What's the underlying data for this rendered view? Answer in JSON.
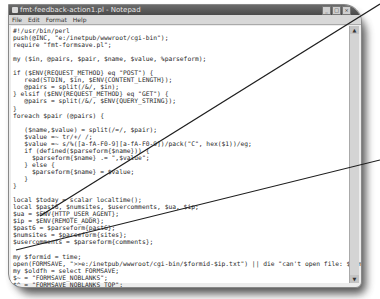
{
  "window": {
    "title": "fmt-feedback-action1.pl - Notepad",
    "controls": [
      "_",
      "□",
      "×"
    ]
  },
  "menu": [
    "File",
    "Edit",
    "Format",
    "Help"
  ],
  "code_lines": [
    "#!/usr/bin/perl",
    "push(@INC, \"e:/inetpub/wwwroot/cgi-bin\");",
    "require \"fmt-formsave.pl\";",
    "",
    "my ($in, @pairs, $pair, $name, $value, %parseform);",
    "",
    "if ($ENV{REQUEST_METHOD} eq \"POST\") {",
    "   read(STDIN, $in, $ENV{CONTENT_LENGTH});",
    "   @pairs = split(/&/, $in);",
    "} elsif ($ENV{REQUEST_METHOD} eq \"GET\") {",
    "   @pairs = split(/&/, $ENV{QUERY_STRING});",
    "}",
    "foreach $pair (@pairs) {",
    "",
    "   ($name,$value) = split(/=/, $pair);",
    "   $value =~ tr/+/ /;",
    "   $value =~ s/%([a-fA-F0-9][a-fA-F0-9])/pack(\"C\", hex($1))/eg;",
    "   if (defined($parseform{$name})) {",
    "     $parseform{$name} .= \",$value\";",
    "   } else {",
    "     $parseform{$name} = $value;",
    "   }",
    "}",
    "",
    "local $today = scalar localtime();",
    "local $past6, $numsites, $usercomments, $ua, $ip;",
    "$ua = $ENV{HTTP_USER_AGENT};",
    "$ip = $ENV{REMOTE_ADDR};",
    "$past6 = $parseform{past6};",
    "$numsites = $parseform{sites};",
    "$usercomments = $parseform{comments};",
    "",
    "my $formid = time;",
    "open(FORMSAVE, \">>e:/inetpub/wwwroot/cgi-bin/$formid-$ip.txt\") || die \"can't open file: $!\\n\";",
    "my $oldfh = select FORMSAVE;",
    "$~ = \"FORMSAVE_NOBLANKS\";",
    "$^ = \"FORMSAVE_NOBLANKS_TOP\";",
    "$= = 40;",
    "select ($oldfh);",
    "",
    "write FORMSAVE;"
  ],
  "annotation_color": "#1e1e1e"
}
